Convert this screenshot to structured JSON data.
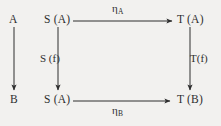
{
  "diagram": {
    "type": "commutative-diagram",
    "background_color": "#f2f1ef",
    "ink_color": "#2e2e2e",
    "nodes": [
      {
        "id": "A",
        "label": "A",
        "x": 14,
        "y": 20
      },
      {
        "id": "B",
        "label": "B",
        "x": 14,
        "y": 100
      },
      {
        "id": "SA_top",
        "label": "S (A)",
        "x": 58,
        "y": 20
      },
      {
        "id": "SA_bot",
        "label": "S (A)",
        "x": 58,
        "y": 100
      },
      {
        "id": "TA",
        "label": "T (A)",
        "x": 190,
        "y": 20
      },
      {
        "id": "TB",
        "label": "T (B)",
        "x": 190,
        "y": 100
      }
    ],
    "edges": [
      {
        "id": "f",
        "from": "A",
        "to": "B",
        "label": "",
        "orientation": "vertical"
      },
      {
        "id": "eta_A",
        "from": "SA_top",
        "to": "TA",
        "label": "η",
        "subscript": "A",
        "orientation": "horizontal"
      },
      {
        "id": "eta_B",
        "from": "SA_bot",
        "to": "TB",
        "label": "η",
        "subscript": "B",
        "orientation": "horizontal"
      },
      {
        "id": "Sf",
        "from": "SA_top",
        "to": "SA_bot",
        "label": "S (f)",
        "orientation": "vertical"
      },
      {
        "id": "Tf",
        "from": "TA",
        "to": "TB",
        "label": "T(f)",
        "orientation": "vertical"
      }
    ],
    "labels": {
      "node_a": "A",
      "node_b": "B",
      "node_sa_top": "S (A)",
      "node_sa_bottom": "S (A)",
      "node_ta": "T (A)",
      "node_tb": "T (B)",
      "edge_eta_a_symbol": "η",
      "edge_eta_a_subscript": "A",
      "edge_eta_b_symbol": "η",
      "edge_eta_b_subscript": "B",
      "edge_sf": "S (f)",
      "edge_tf": "T(f)"
    }
  }
}
